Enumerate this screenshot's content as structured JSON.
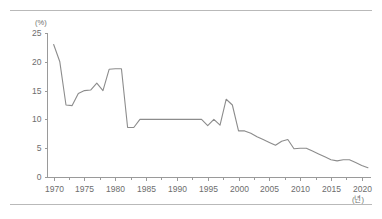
{
  "figure": {
    "name": "line-chart-figure",
    "y_axis_unit": "(%)",
    "x_axis_unit": "(년)"
  },
  "chart_data": {
    "type": "line",
    "title": "",
    "subtitle": "",
    "xlabel": "(년)",
    "ylabel": "(%)",
    "xlim": [
      1969,
      2021.5
    ],
    "ylim": [
      0,
      25
    ],
    "grid": false,
    "legend": null,
    "y_ticks": [
      0,
      5,
      10,
      15,
      20,
      25
    ],
    "y_tick_labels": [
      "0",
      "5",
      "10",
      "15",
      "20",
      "25"
    ],
    "x_ticks": [
      1970,
      1975,
      1980,
      1985,
      1990,
      1995,
      2000,
      2005,
      2010,
      2015,
      2020
    ],
    "x_tick_labels": [
      "1970",
      "1975",
      "1980",
      "1985",
      "1990",
      "1995",
      "2000",
      "2005",
      "2010",
      "2015",
      "2020"
    ],
    "x_minor_ticks": [
      1972.5,
      1977.5,
      1982.5,
      1987.5,
      1992.5,
      1997.5,
      2002.5,
      2007.5,
      2012.5,
      2017.5
    ],
    "series": [
      {
        "name": "rate",
        "color": "#8c8c8c",
        "x": [
          1970,
          1971,
          1972,
          1973,
          1974,
          1975,
          1976,
          1977,
          1978,
          1979,
          1980,
          1981,
          1982,
          1983,
          1984,
          1985,
          1986,
          1987,
          1988,
          1989,
          1990,
          1991,
          1992,
          1993,
          1994,
          1995,
          1996,
          1997,
          1998,
          1999,
          2000,
          2001,
          2002,
          2003,
          2004,
          2005,
          2006,
          2007,
          2008,
          2009,
          2010,
          2011,
          2012,
          2013,
          2014,
          2015,
          2016,
          2017,
          2018,
          2019,
          2020,
          2021
        ],
        "values": [
          23.0,
          20.0,
          12.5,
          12.4,
          14.5,
          15.0,
          15.1,
          16.3,
          15.0,
          18.7,
          18.8,
          18.8,
          8.6,
          8.6,
          10.0,
          10.0,
          10.0,
          10.0,
          10.0,
          10.0,
          10.0,
          10.0,
          10.0,
          10.0,
          10.0,
          8.9,
          10.0,
          9.0,
          13.5,
          12.5,
          8.0,
          8.0,
          7.6,
          7.0,
          6.5,
          6.0,
          5.5,
          6.2,
          6.5,
          4.9,
          5.0,
          5.0,
          4.5,
          4.0,
          3.5,
          3.0,
          2.8,
          3.0,
          3.0,
          2.5,
          2.0,
          1.6
        ]
      }
    ]
  }
}
